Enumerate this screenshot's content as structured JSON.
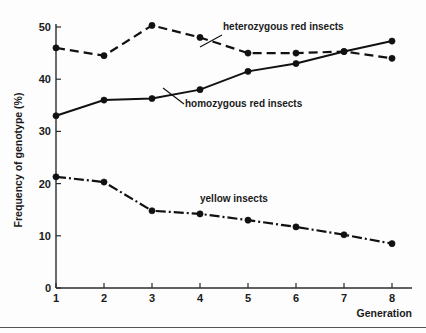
{
  "chart_data": {
    "type": "line",
    "title": "",
    "xlabel": "Generation",
    "ylabel": "Frequency of genotype (%)",
    "x": [
      1,
      2,
      3,
      4,
      5,
      6,
      7,
      8
    ],
    "xlim": [
      1,
      8
    ],
    "ylim": [
      0,
      50
    ],
    "xticks": [
      "1",
      "2",
      "3",
      "4",
      "5",
      "6",
      "7",
      "8"
    ],
    "yticks": [
      "0",
      "10",
      "20",
      "30",
      "40",
      "50"
    ],
    "grid": false,
    "legend_position": "inline-annotations",
    "series": [
      {
        "name": "heterozygous red insects",
        "label": "heterozygous red insects",
        "linestyle": "dashed",
        "marker": "filled-circle",
        "color": "#111111",
        "values": [
          46,
          44.5,
          50.3,
          48,
          45,
          45,
          45.3,
          44
        ]
      },
      {
        "name": "homozygous red insects",
        "label": "homozygous red insects",
        "linestyle": "solid",
        "marker": "filled-circle",
        "color": "#111111",
        "values": [
          33,
          36,
          36.3,
          38,
          41.5,
          43,
          45.3,
          47.3
        ]
      },
      {
        "name": "yellow insects",
        "label": "yellow insects",
        "linestyle": "dash-dot",
        "marker": "filled-circle",
        "color": "#111111",
        "values": [
          21.3,
          20.3,
          14.8,
          14.2,
          13,
          11.7,
          10.2,
          8.5
        ]
      }
    ],
    "annotations": [
      {
        "text": "heterozygous red insects",
        "x_px": 223,
        "y_px": 30
      },
      {
        "text": "homozygous red insects",
        "x_px": 185,
        "y_px": 107
      },
      {
        "text": "yellow insects",
        "x_px": 200,
        "y_px": 202
      }
    ]
  }
}
